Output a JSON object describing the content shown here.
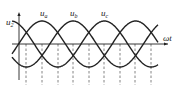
{
  "figure": {
    "type": "three-phase-voltage-waveform",
    "y_axis_label": {
      "base": "u",
      "sub": "2"
    },
    "x_axis_label": "ωt",
    "curves": [
      {
        "name": "u_a",
        "base": "u",
        "sub": "a",
        "phase_deg": 0
      },
      {
        "name": "u_b",
        "base": "u",
        "sub": "b",
        "phase_deg": 120
      },
      {
        "name": "u_c",
        "base": "u",
        "sub": "c",
        "phase_deg": 240
      }
    ],
    "stroke_color": "#222222",
    "dashed_color": "#666666"
  },
  "layout": {
    "origin_x": 19,
    "axis_y": 44,
    "amplitude": 23,
    "px_per_60deg": 15.6,
    "peak_a_x": 42,
    "x_start": 12,
    "x_end": 158,
    "x_axis_end": 168,
    "y_axis_top": 14,
    "y_axis_bottom": 80,
    "dashed_xs": [
      26,
      42,
      58,
      73,
      89,
      104,
      120,
      135,
      151
    ],
    "dashed_top": 44,
    "dashed_bottom": 85
  }
}
